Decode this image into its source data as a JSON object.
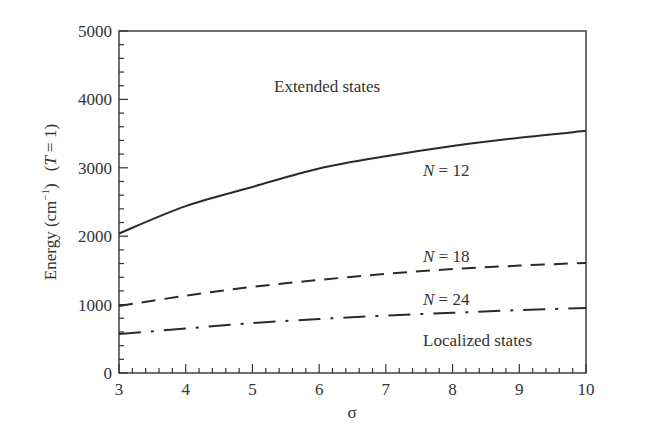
{
  "chart_data": {
    "type": "line",
    "title": "",
    "xlabel": "σ",
    "ylabel": "Energy (cm⁻¹)   (T = 1)",
    "xlim": [
      3,
      10
    ],
    "ylim": [
      0,
      5000
    ],
    "xticks": [
      3,
      4,
      5,
      6,
      7,
      8,
      9,
      10
    ],
    "yticks": [
      0,
      1000,
      2000,
      3000,
      4000,
      5000
    ],
    "x_minor_step": 0.2,
    "y_minor_step": 200,
    "grid": false,
    "legend": null,
    "x": [
      3,
      4,
      5,
      6,
      7,
      8,
      9,
      10
    ],
    "series": [
      {
        "name": "N = 12",
        "style": "solid",
        "values": [
          2040,
          2440,
          2720,
          2990,
          3170,
          3320,
          3440,
          3540
        ]
      },
      {
        "name": "N = 18",
        "style": "dashed",
        "values": [
          980,
          1130,
          1260,
          1360,
          1450,
          1520,
          1570,
          1610
        ]
      },
      {
        "name": "N = 24",
        "style": "dash-dot",
        "values": [
          570,
          650,
          730,
          790,
          840,
          880,
          920,
          950
        ]
      }
    ],
    "annotations": [
      {
        "text": "Extended states",
        "x": 5.1,
        "y": 4180
      },
      {
        "text": "Localized states",
        "x": 7.2,
        "y": 490
      },
      {
        "text": "N = 12",
        "x": 7.3,
        "y": 2900,
        "series": "N = 12"
      },
      {
        "text": "N = 18",
        "x": 7.3,
        "y": 1590,
        "series": "N = 18"
      },
      {
        "text": "N = 24",
        "x": 7.3,
        "y": 980,
        "series": "N = 24"
      }
    ]
  },
  "labels": {
    "x_axis": "σ",
    "y_axis_main": "Energy (cm",
    "y_axis_sup": "−1",
    "y_axis_close": ")",
    "y_axis_cond_open": "(",
    "y_axis_cond_var": "T",
    "y_axis_cond_rest": " = 1)",
    "extended": "Extended states",
    "localized": "Localized states",
    "n_var": "N",
    "n12": " = 12",
    "n18": " = 18",
    "n24": " = 24"
  },
  "colors": {
    "line": "#2a2a2a",
    "axis": "#333333",
    "background": "#ffffff"
  }
}
